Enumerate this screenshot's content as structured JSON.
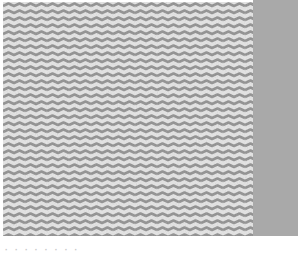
{
  "image": {
    "type": "texture-sample",
    "pattern": "wavy-chevron-stripes",
    "colors": {
      "background": "#ffffff",
      "texture_light": "#e4e4e4",
      "texture_dark": "#8e8e8e",
      "swatch": "#a9a9a9"
    },
    "wave_period_px": 22,
    "band_spacing_px": 7
  },
  "caption": {
    "text": "· · ·    ·          ·   ·     · ·"
  }
}
